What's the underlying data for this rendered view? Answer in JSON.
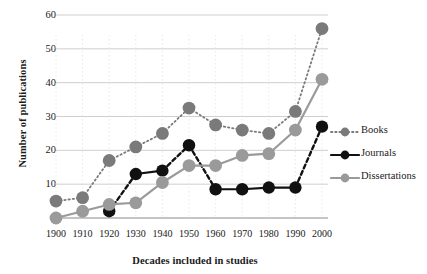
{
  "chart_data": {
    "type": "line",
    "title": "",
    "xlabel": "Decades included in studies",
    "ylabel": "Number of publications",
    "categories": [
      "1900",
      "1910",
      "1920",
      "1930",
      "1940",
      "1950",
      "1960",
      "1970",
      "1980",
      "1990",
      "2000"
    ],
    "x": [
      1900,
      1910,
      1920,
      1930,
      1940,
      1950,
      1960,
      1970,
      1980,
      1990,
      2000
    ],
    "ylim": [
      0,
      60
    ],
    "yticks": [
      0,
      10,
      20,
      30,
      40,
      50,
      60
    ],
    "grid": "horizontal",
    "legend_position": "right",
    "series": [
      {
        "name": "Books",
        "color": "#7a7a7a",
        "line_style": "dotted",
        "values": [
          5,
          6,
          17,
          21,
          25,
          32.5,
          27.5,
          26,
          25,
          31.5,
          56
        ]
      },
      {
        "name": "Journals",
        "color": "#111111",
        "line_style": "dashed-solid",
        "values": [
          null,
          null,
          2,
          13,
          14,
          21.5,
          8.5,
          8.5,
          9,
          9,
          27
        ]
      },
      {
        "name": "Dissertations",
        "color": "#9a9a9a",
        "line_style": "solid",
        "values": [
          0,
          2,
          4,
          4.5,
          10.5,
          15.5,
          15.5,
          18.5,
          19,
          26,
          41
        ]
      }
    ]
  },
  "axes": {
    "y_title": "Number of publications",
    "x_title": "Decades included in studies",
    "y_tick_labels": [
      "0",
      "10",
      "20",
      "30",
      "40",
      "50",
      "60"
    ],
    "x_tick_labels": [
      "1900",
      "1910",
      "1920",
      "1930",
      "1940",
      "1950",
      "1960",
      "1970",
      "1980",
      "1990",
      "2000"
    ]
  },
  "legend": {
    "items": [
      {
        "label": "Books",
        "icon": "dotted-line-marker-icon",
        "color": "#7a7a7a"
      },
      {
        "label": "Journals",
        "icon": "solid-line-marker-icon",
        "color": "#111111"
      },
      {
        "label": "Dissertations",
        "icon": "solid-line-marker-icon",
        "color": "#9a9a9a"
      }
    ]
  },
  "colors": {
    "books": "#7a7a7a",
    "journals": "#111111",
    "dissertations": "#9a9a9a",
    "grid": "#c9c9c9",
    "axis": "#8a8a8a",
    "background": "#ffffff"
  }
}
